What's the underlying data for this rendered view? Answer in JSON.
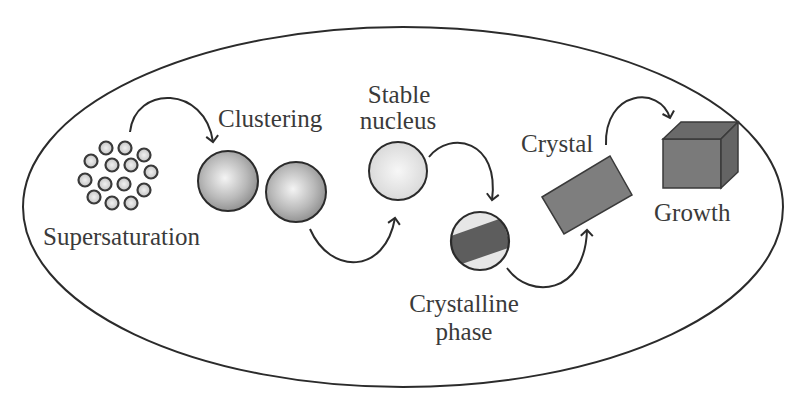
{
  "diagram": {
    "stages": [
      {
        "id": "supersaturation",
        "label": "Supersaturation"
      },
      {
        "id": "clustering",
        "label": "Clustering"
      },
      {
        "id": "stable-nucleus",
        "label_line1": "Stable",
        "label_line2": "nucleus"
      },
      {
        "id": "crystalline-phase",
        "label_line1": "Crystalline",
        "label_line2": "phase"
      },
      {
        "id": "crystal",
        "label": "Crystal"
      },
      {
        "id": "growth",
        "label": "Growth"
      }
    ],
    "colors": {
      "outline": "#2b2b2b",
      "text": "#3a3a3a",
      "sphere_dark": "#8c8c8c",
      "sphere_light": "#f2f2f2",
      "crystal_fill": "#7e7e7e",
      "crystal_dark": "#5f5f5f"
    }
  }
}
